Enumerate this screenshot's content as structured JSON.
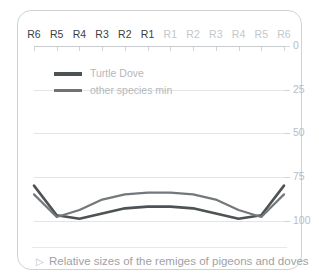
{
  "chart_data": {
    "type": "line",
    "title": "",
    "xlabel": "",
    "ylabel": "",
    "grid": true,
    "legend_position": "top-left",
    "axis_note": "y-axis inverted: 0 at top, 100 at bottom",
    "categories": [
      "R6",
      "R5",
      "R4",
      "R3",
      "R2",
      "R1",
      "R1",
      "R2",
      "R3",
      "R4",
      "R5",
      "R6"
    ],
    "category_sides": [
      "left",
      "left",
      "left",
      "left",
      "left",
      "left",
      "right",
      "right",
      "right",
      "right",
      "right",
      "right"
    ],
    "xtick_labels": [
      "R6",
      "R5",
      "R4",
      "R3",
      "R2",
      "R1",
      "R1",
      "R2",
      "R3",
      "R4",
      "R5",
      "R6"
    ],
    "ytick_labels": [
      "0",
      "25",
      "50",
      "75",
      "100"
    ],
    "yticks": [
      0,
      25,
      50,
      75,
      100
    ],
    "ylim": [
      0,
      110
    ],
    "series": [
      {
        "name": "Turtle Dove",
        "color": "#4d5255",
        "width": 2.6,
        "values": [
          80,
          97,
          99,
          96,
          93,
          92,
          92,
          93,
          96,
          99,
          97,
          80
        ]
      },
      {
        "name": "other species min",
        "color": "#72787b",
        "width": 2.2,
        "values": [
          85,
          98,
          94,
          88,
          85,
          84,
          84,
          85,
          88,
          94,
          98,
          85
        ]
      }
    ]
  },
  "legend": {
    "items": [
      {
        "label": "Turtle Dove",
        "style": "thick"
      },
      {
        "label": "other species min",
        "style": "thin"
      }
    ]
  },
  "caption": {
    "marker": "▷",
    "text": "Relative sizes of the remiges of pigeons and doves"
  },
  "colors": {
    "card_border": "#cfd2d4",
    "grid": "#e3e5e7",
    "axis": "#c9cccf",
    "label_dark": "#3a3f42",
    "label_light": "#c3c7ca",
    "ylabel": "#b9bdc0",
    "legend_text": "#b4b8bb",
    "caption_text": "#9ea2a5",
    "series_primary": "#4d5255",
    "series_secondary": "#72787b"
  }
}
